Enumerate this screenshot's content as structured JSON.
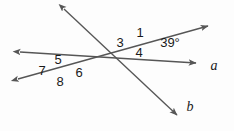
{
  "figure": {
    "type": "geometry-diagram",
    "background_color": "#fdfdfd",
    "stroke_color": "#565656",
    "text_color": "#1a1a1a",
    "width": 234,
    "height": 131
  },
  "angle_labels": [
    {
      "id": "angle-1",
      "text": "1",
      "x": 140,
      "y": 32
    },
    {
      "id": "angle-3",
      "text": "3",
      "x": 120,
      "y": 42
    },
    {
      "id": "angle-4",
      "text": "4",
      "x": 139,
      "y": 52
    },
    {
      "id": "angle-5",
      "text": "5",
      "x": 58,
      "y": 59
    },
    {
      "id": "angle-6",
      "text": "6",
      "x": 79,
      "y": 72
    },
    {
      "id": "angle-7",
      "text": "7",
      "x": 42,
      "y": 70
    },
    {
      "id": "angle-8",
      "text": "8",
      "x": 60,
      "y": 81
    },
    {
      "id": "angle-39",
      "text": "39°",
      "x": 170,
      "y": 42
    }
  ],
  "line_labels": [
    {
      "id": "line-label-a",
      "text": "a",
      "x": 214,
      "y": 66
    },
    {
      "id": "line-label-b",
      "text": "b",
      "x": 190,
      "y": 107
    }
  ],
  "lines": [
    {
      "id": "line-upper-transversal",
      "note": "runs from upper-left arrow down through both intersections to lower-right arrow b",
      "x1": 64,
      "y1": 9,
      "x2": 177,
      "y2": 115,
      "arrow_start": true,
      "arrow_end": true
    },
    {
      "id": "line-ray-a",
      "note": "runs from upper-left arrow at left edge down-right to arrow near label a",
      "x1": 20,
      "y1": 52,
      "x2": 196,
      "y2": 63,
      "arrow_start": true,
      "arrow_end": true
    },
    {
      "id": "line-ray-top",
      "note": "runs from lower-left arrow up-right to top-right arrow",
      "x1": 18,
      "y1": 79,
      "x2": 208,
      "y2": 26,
      "arrow_start": true,
      "arrow_end": true
    }
  ],
  "intersections": [
    {
      "id": "intersection-right",
      "x": 140,
      "y": 43
    },
    {
      "id": "intersection-left",
      "x": 58,
      "y": 69
    }
  ]
}
